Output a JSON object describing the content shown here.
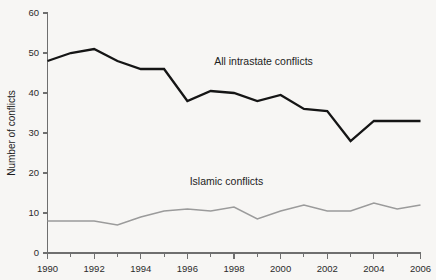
{
  "chart_data": {
    "type": "line",
    "title": "",
    "subtitle": "",
    "xlabel": "",
    "ylabel": "Number of conflicts",
    "x": [
      1990,
      1991,
      1992,
      1993,
      1994,
      1995,
      1996,
      1997,
      1998,
      1999,
      2000,
      2001,
      2002,
      2003,
      2004,
      2005,
      2006
    ],
    "xlim": [
      1990,
      2006
    ],
    "ylim": [
      0,
      60
    ],
    "y_ticks": [
      0,
      10,
      20,
      30,
      40,
      50,
      60
    ],
    "y_tick_labels": [
      "0",
      "10",
      "20",
      "30",
      "40",
      "50",
      "60"
    ],
    "x_ticks": [
      1990,
      1991,
      1992,
      1993,
      1994,
      1995,
      1996,
      1997,
      1998,
      1999,
      2000,
      2001,
      2002,
      2003,
      2004,
      2005,
      2006
    ],
    "x_tick_labels_major": [
      "1990",
      "1992",
      "1994",
      "1996",
      "1998",
      "2000",
      "2002",
      "2004",
      "2006"
    ],
    "x_major_values": [
      1990,
      1992,
      1994,
      1996,
      1998,
      2000,
      2002,
      2004,
      2006
    ],
    "grid": false,
    "legend_position": "inline-annotations",
    "series": [
      {
        "name": "All intrastate conflicts",
        "color": "#151515",
        "width": 2.3,
        "annotation": "All intrastate conflicts",
        "annotation_x": 1997.15,
        "annotation_y": 47.0,
        "values": [
          48,
          50,
          51,
          48,
          46,
          46,
          38,
          40.5,
          40,
          38,
          39.5,
          36,
          35.5,
          28,
          33,
          33,
          33
        ]
      },
      {
        "name": "Islamic conflicts",
        "color": "#9b9b9b",
        "width": 1.6,
        "annotation": "Islamic conflicts",
        "annotation_x": 1996.1,
        "annotation_y": 17.0,
        "values": [
          8,
          8,
          8,
          7,
          9,
          10.5,
          11,
          10.5,
          11.5,
          8.5,
          10.5,
          12,
          10.5,
          10.5,
          12.5,
          11,
          12
        ]
      }
    ]
  }
}
